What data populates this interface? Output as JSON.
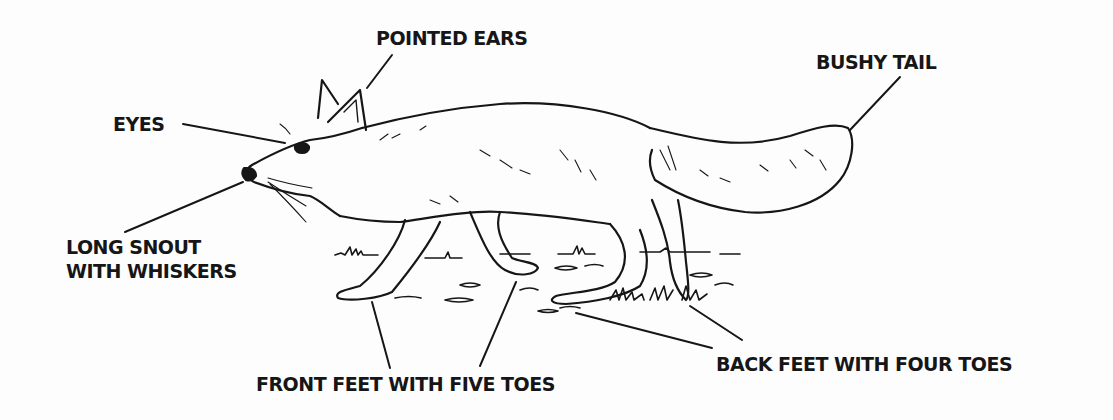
{
  "diagram": {
    "colors": {
      "ink": "#161616",
      "background": "#fdfdfd"
    },
    "labels": {
      "pointed_ears": "POINTED EARS",
      "bushy_tail": "BUSHY TAIL",
      "eyes": "EYES",
      "long_snout_line1": "LONG SNOUT",
      "long_snout_line2": "WITH WHISKERS",
      "front_feet": "FRONT FEET WITH FIVE TOES",
      "back_feet": "BACK FEET WITH FOUR TOES"
    }
  }
}
